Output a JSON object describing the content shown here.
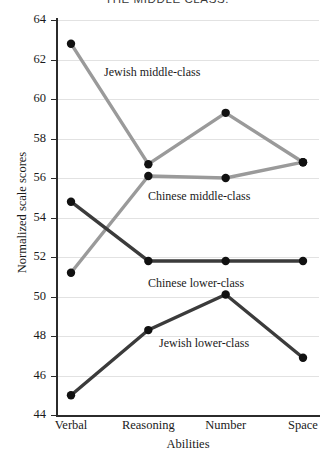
{
  "chart_data": {
    "type": "line",
    "title": "THE MIDDLE CLASS.",
    "xlabel": "Abilities",
    "ylabel": "Normalized scale scores",
    "categories": [
      "Verbal",
      "Reasoning",
      "Number",
      "Space"
    ],
    "ylim": [
      44,
      64
    ],
    "yticks": [
      44,
      46,
      48,
      50,
      52,
      54,
      56,
      58,
      60,
      62,
      64
    ],
    "grid": true,
    "legend_position": "inline-labels",
    "series": [
      {
        "name": "Jewish middle-class",
        "color": "#9a9a9a",
        "values": [
          62.8,
          56.7,
          59.3,
          56.8
        ]
      },
      {
        "name": "Chinese middle-class",
        "color": "#9a9a9a",
        "values": [
          51.2,
          56.1,
          56.0,
          56.8
        ]
      },
      {
        "name": "Chinese lower-class",
        "color": "#3b3b3b",
        "values": [
          54.8,
          51.8,
          51.8,
          51.8
        ]
      },
      {
        "name": "Jewish lower-class",
        "color": "#3b3b3b",
        "values": [
          45.0,
          48.3,
          50.1,
          46.9
        ]
      }
    ]
  },
  "axis": {
    "y_tick_labels": [
      "64",
      "62",
      "60",
      "58",
      "56",
      "54",
      "52",
      "50",
      "48",
      "46",
      "44"
    ],
    "x_tick_labels": [
      "Verbal",
      "Reasoning",
      "Number",
      "Space"
    ],
    "x_title": "Abilities",
    "y_title": "Normalized scale scores"
  },
  "labels": {
    "jewish_middle": "Jewish middle-class",
    "chinese_middle": "Chinese middle-class",
    "chinese_lower": "Chinese lower-class",
    "jewish_lower": "Jewish lower-class"
  },
  "header": {
    "title": "THE MIDDLE CLASS."
  }
}
